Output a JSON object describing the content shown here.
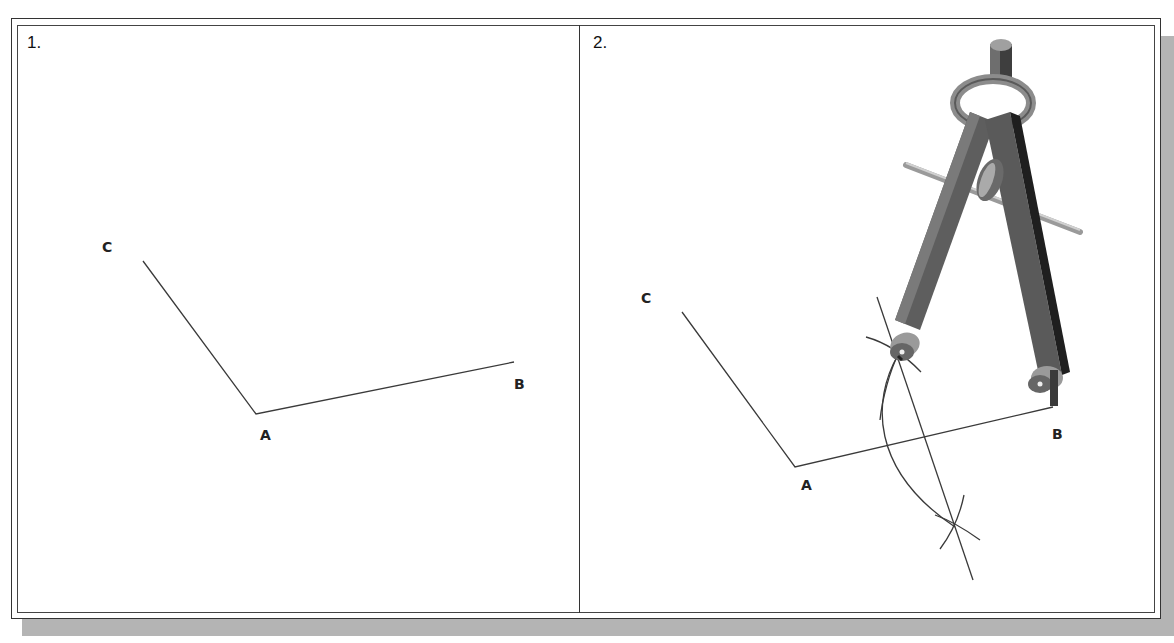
{
  "panels": [
    {
      "step": "1.",
      "points": {
        "A": "A",
        "B": "B",
        "C": "C"
      }
    },
    {
      "step": "2.",
      "points": {
        "A": "A",
        "B": "B",
        "C": "C"
      }
    }
  ],
  "colors": {
    "line": "#3a3a3a",
    "frame": "#333333",
    "shadow": "#b4b4b4",
    "compass_dark": "#4a4a4a",
    "compass_mid": "#7a7a7a",
    "compass_light": "#b8b8b8"
  },
  "icons": {
    "compass": "drafting-compass-icon"
  }
}
